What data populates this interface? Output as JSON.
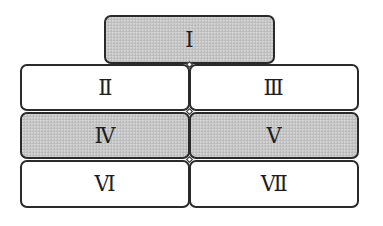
{
  "diagram": {
    "type": "block-arrangement",
    "boxes": [
      {
        "id": "I",
        "label": "Ⅰ",
        "row": 0,
        "column": "center",
        "shaded": true
      },
      {
        "id": "II",
        "label": "Ⅱ",
        "row": 1,
        "column": "left",
        "shaded": false
      },
      {
        "id": "III",
        "label": "Ⅲ",
        "row": 1,
        "column": "right",
        "shaded": false
      },
      {
        "id": "IV",
        "label": "Ⅳ",
        "row": 2,
        "column": "left",
        "shaded": true
      },
      {
        "id": "V",
        "label": "Ⅴ",
        "row": 2,
        "column": "right",
        "shaded": true
      },
      {
        "id": "VI",
        "label": "Ⅵ",
        "row": 3,
        "column": "left",
        "shaded": false
      },
      {
        "id": "VII",
        "label": "Ⅶ",
        "row": 3,
        "column": "right",
        "shaded": false
      }
    ],
    "colors": {
      "shaded_fill": "#c6c6c6",
      "plain_fill": "#ffffff",
      "border": "#2a2a2a",
      "text": "#1e1e1e"
    }
  }
}
